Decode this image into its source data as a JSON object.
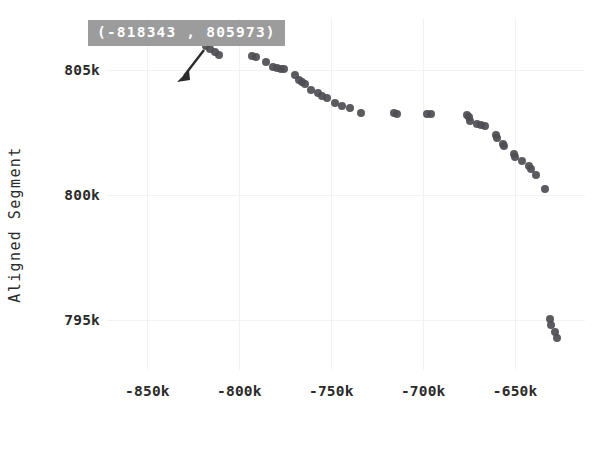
{
  "figure": {
    "background": "#ffffff",
    "point_color": "#4d4d52",
    "grid_color": "#f2f2f4",
    "tooltip_bg": "#9c9c9c",
    "tooltip_fg": "#ffffff"
  },
  "annotation": {
    "label": "(-818343 , 805973)",
    "x": -818343,
    "y": 805973,
    "arrow": "arrow-pointer"
  },
  "axes": {
    "y_title": "Aligned Segment",
    "x_title": "",
    "y_ticks": [
      {
        "label": "805k",
        "value": 805000
      },
      {
        "label": "800k",
        "value": 800000
      },
      {
        "label": "795k",
        "value": 795000
      }
    ],
    "x_ticks": [
      {
        "label": "-850k",
        "value": -850000
      },
      {
        "label": "-800k",
        "value": -800000
      },
      {
        "label": "-750k",
        "value": -750000
      },
      {
        "label": "-700k",
        "value": -700000
      },
      {
        "label": "-650k",
        "value": -650000
      }
    ]
  },
  "chart_data": {
    "type": "scatter",
    "title": "",
    "xlabel": "",
    "ylabel": "Aligned Segment",
    "xlim": [
      -872000,
      -612000
    ],
    "ylim": [
      793000,
      807100
    ],
    "grid": true,
    "legend": "none",
    "annotations": [
      {
        "text": "(-818343 , 805973)",
        "x": -818343,
        "y": 805973
      }
    ],
    "series": [
      {
        "name": "alignment dot plot",
        "marker": "circle",
        "color": "#4d4d52",
        "points": [
          [
            -818343,
            805973
          ],
          [
            -816000,
            805870
          ],
          [
            -813500,
            805720
          ],
          [
            -811000,
            805620
          ],
          [
            -793000,
            805560
          ],
          [
            -791000,
            805530
          ],
          [
            -785500,
            805330
          ],
          [
            -781500,
            805120
          ],
          [
            -779500,
            805090
          ],
          [
            -777500,
            805065
          ],
          [
            -775500,
            805040
          ],
          [
            -770000,
            804800
          ],
          [
            -767500,
            804620
          ],
          [
            -766000,
            804530
          ],
          [
            -764500,
            804440
          ],
          [
            -761000,
            804230
          ],
          [
            -757500,
            804100
          ],
          [
            -755000,
            803970
          ],
          [
            -752500,
            803900
          ],
          [
            -748000,
            803700
          ],
          [
            -744000,
            803560
          ],
          [
            -740000,
            803480
          ],
          [
            -734000,
            803310
          ],
          [
            -716000,
            803280
          ],
          [
            -714000,
            803270
          ],
          [
            -698000,
            803260
          ],
          [
            -696000,
            803250
          ],
          [
            -676000,
            803210
          ],
          [
            -675000,
            803130
          ],
          [
            -674500,
            802990
          ],
          [
            -670500,
            802850
          ],
          [
            -668500,
            802800
          ],
          [
            -666500,
            802780
          ],
          [
            -660500,
            802430
          ],
          [
            -660000,
            802280
          ],
          [
            -656500,
            802060
          ],
          [
            -656000,
            801960
          ],
          [
            -650500,
            801660
          ],
          [
            -650000,
            801540
          ],
          [
            -646000,
            801370
          ],
          [
            -642500,
            801180
          ],
          [
            -641500,
            801060
          ],
          [
            -638500,
            800800
          ],
          [
            -634000,
            800260
          ],
          [
            -631000,
            795060
          ],
          [
            -630500,
            794790
          ],
          [
            -628500,
            794510
          ],
          [
            -627500,
            794270
          ]
        ]
      }
    ]
  }
}
